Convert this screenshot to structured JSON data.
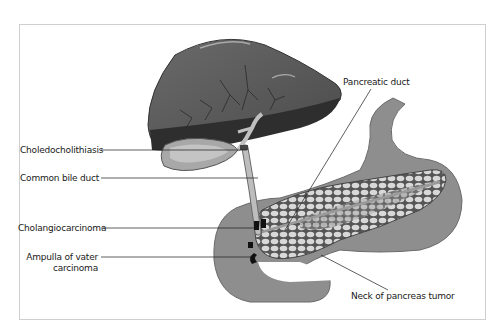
{
  "diagram": {
    "type": "anatomical illustration",
    "labels": {
      "choledocholithiasis": "Choledocholithiasis",
      "common_bile_duct": "Common bile duct",
      "cholangiocarcinoma": "Cholangiocarcinoma",
      "ampulla_line1": "Ampulla of vater",
      "ampulla_line2": "carcinoma",
      "pancreatic_duct": "Pancreatic duct",
      "neck_tumor": "Neck of pancreas tumor"
    },
    "colors": {
      "liver": "#5a5a5a",
      "liver_dark": "#2e2e2e",
      "gallbladder": "#9a9a9a",
      "duct": "#b8b8b8",
      "stomach": "#8c8c8c",
      "pancreas_cell": "#d6d6d6",
      "tumor": "#111111",
      "frame": "#cfcfcf"
    }
  }
}
